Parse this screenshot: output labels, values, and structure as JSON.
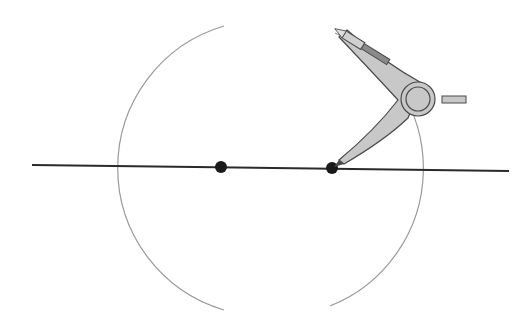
{
  "diagram": {
    "type": "geometric-construction",
    "colors": {
      "background": "#ffffff",
      "line": "#2a2a2a",
      "arc": "#9a9a9a",
      "point": "#1a1a1a",
      "compass_fill": "#c8c8c8",
      "compass_stroke": "#4a4a4a",
      "pencil_lead": "#7a7a7a"
    },
    "line": {
      "x1": 32,
      "y1": 165,
      "x2": 509,
      "y2": 171
    },
    "points": [
      {
        "name": "point-a",
        "cx": 221,
        "cy": 167,
        "r": 6
      },
      {
        "name": "point-b",
        "cx": 332,
        "cy": 168,
        "r": 6
      }
    ],
    "arcs": [
      {
        "name": "arc-centered-b",
        "cx": 332,
        "cy": 168,
        "r": 148
      },
      {
        "name": "arc-centered-a",
        "cx": 221,
        "cy": 167,
        "r": 148
      }
    ],
    "intersections": [
      {
        "name": "top-intersection",
        "x": 278,
        "y": 38
      },
      {
        "name": "bottom-intersection",
        "x": 276,
        "y": 298
      }
    ]
  }
}
